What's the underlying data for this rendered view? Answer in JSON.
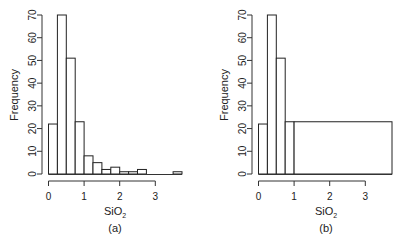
{
  "chart_data": [
    {
      "type": "bar",
      "panel_label": "(a)",
      "xlabel": "SiO2",
      "ylabel": "Frequency",
      "bin_edges": [
        0,
        0.25,
        0.5,
        0.75,
        1.0,
        1.25,
        1.5,
        1.75,
        2.0,
        2.25,
        2.5,
        2.75,
        3.0,
        3.25,
        3.5,
        3.75
      ],
      "values": [
        22,
        70,
        51,
        23,
        8,
        5,
        2,
        3,
        1,
        1,
        2,
        0,
        0,
        0,
        1
      ],
      "xticks": [
        "0",
        "1",
        "2",
        "3"
      ],
      "yticks": [
        "0",
        "10",
        "20",
        "30",
        "40",
        "50",
        "60",
        "70"
      ],
      "ylim": [
        0,
        70
      ],
      "xlim": [
        0,
        3.75
      ],
      "grid": false
    },
    {
      "type": "bar",
      "panel_label": "(b)",
      "xlabel": "SiO2",
      "ylabel": "Frequency",
      "bin_edges": [
        0,
        0.25,
        0.5,
        0.75,
        1.0,
        3.75
      ],
      "values": [
        22,
        70,
        51,
        23,
        23
      ],
      "xticks": [
        "0",
        "1",
        "2",
        "3"
      ],
      "yticks": [
        "0",
        "10",
        "20",
        "30",
        "40",
        "50",
        "60",
        "70"
      ],
      "ylim": [
        0,
        70
      ],
      "xlim": [
        0,
        3.75
      ],
      "grid": false
    }
  ],
  "panels": [
    {
      "ylabel": "Frequency",
      "xlabel_main": "SiO",
      "xlabel_sub": "2",
      "caption": "(a)"
    },
    {
      "ylabel": "Frequency",
      "xlabel_main": "SiO",
      "xlabel_sub": "2",
      "caption": "(b)"
    }
  ]
}
